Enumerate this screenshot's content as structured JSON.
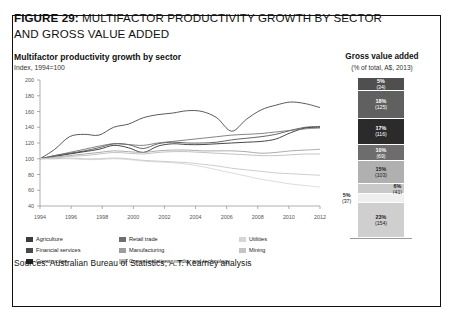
{
  "figure": {
    "number_label": "FIGURE 29:",
    "title_line1": "MULTIFACTOR PRODUCTIVITY GROWTH BY SECTOR",
    "title_line2": "AND GROSS VALUE ADDED",
    "sources": "Sources: Australian Bureau of Statistics; A.T. Kearney analysis"
  },
  "left_panel": {
    "heading": "Multifactor productivity growth by sector",
    "subheading": "Index, 1994=100"
  },
  "right_panel": {
    "heading": "Gross value added",
    "subheading": "(% of total, A$, 2013)"
  },
  "legend": {
    "columns": [
      [
        {
          "label": "Agriculture",
          "color": "#3c3c3c"
        },
        {
          "label": "Financial services",
          "color": "#4a4a4a"
        },
        {
          "label": "Construction",
          "color": "#262626"
        }
      ],
      [
        {
          "label": "Retail trade",
          "color": "#6e6e6e"
        },
        {
          "label": "Manufacturing",
          "color": "#9d9d9d"
        },
        {
          "label": "Communications, media, and technology",
          "color": "#b8b8b8"
        }
      ],
      [
        {
          "label": "Utilities",
          "color": "#d6d6d6"
        },
        {
          "label": "Mining",
          "color": "#c4c4c4"
        }
      ]
    ]
  },
  "chart_data": [
    {
      "type": "line",
      "title": "Multifactor productivity growth by sector",
      "subtitle": "Index, 1994=100",
      "xlabel": "",
      "ylabel": "Index, 1994=100",
      "xlim": [
        1994,
        2012
      ],
      "ylim": [
        40,
        200
      ],
      "yticks": [
        40,
        60,
        80,
        100,
        120,
        140,
        160,
        180,
        200
      ],
      "xticks": [
        1994,
        1996,
        1998,
        2000,
        2002,
        2004,
        2006,
        2008,
        2010,
        2012
      ],
      "grid": false,
      "legend_position": "bottom",
      "x": [
        1994,
        1995,
        1996,
        1997,
        1998,
        1999,
        2000,
        2001,
        2002,
        2003,
        2004,
        2005,
        2006,
        2007,
        2008,
        2009,
        2010,
        2011,
        2012
      ],
      "series": [
        {
          "name": "Agriculture",
          "color": "#3c3c3c",
          "values": [
            100,
            112,
            128,
            131,
            130,
            140,
            144,
            152,
            156,
            158,
            161,
            160,
            152,
            135,
            150,
            162,
            168,
            172,
            170,
            165
          ]
        },
        {
          "name": "Financial services",
          "color": "#4a4a4a",
          "values": [
            100,
            104,
            107,
            110,
            114,
            119,
            118,
            113,
            119,
            121,
            120,
            120,
            121,
            124,
            126,
            128,
            131,
            136,
            140,
            141
          ]
        },
        {
          "name": "Construction",
          "color": "#262626",
          "values": [
            100,
            103,
            106,
            109,
            112,
            117,
            114,
            108,
            116,
            119,
            118,
            118,
            119,
            120,
            121,
            122,
            125,
            133,
            139,
            140
          ]
        },
        {
          "name": "Retail trade",
          "color": "#6e6e6e",
          "values": [
            100,
            104,
            108,
            112,
            116,
            119,
            118,
            117,
            120,
            122,
            124,
            126,
            128,
            130,
            131,
            132,
            134,
            136,
            138,
            139
          ]
        },
        {
          "name": "Manufacturing",
          "color": "#9d9d9d",
          "values": [
            100,
            102,
            104,
            106,
            108,
            110,
            109,
            108,
            110,
            111,
            111,
            110,
            110,
            110,
            109,
            107,
            108,
            110,
            111,
            112
          ]
        },
        {
          "name": "Communications, media, and technology",
          "color": "#b8b8b8",
          "values": [
            100,
            101,
            103,
            104,
            106,
            108,
            107,
            106,
            108,
            109,
            109,
            108,
            107,
            106,
            105,
            104,
            104,
            105,
            106,
            106
          ]
        },
        {
          "name": "Utilities",
          "color": "#d6d6d6",
          "values": [
            100,
            100,
            100,
            99,
            99,
            100,
            99,
            97,
            96,
            95,
            93,
            90,
            86,
            82,
            78,
            74,
            71,
            68,
            66,
            64
          ]
        },
        {
          "name": "Mining",
          "color": "#c4c4c4",
          "values": [
            100,
            100,
            101,
            100,
            100,
            101,
            100,
            98,
            97,
            96,
            95,
            93,
            91,
            88,
            86,
            84,
            82,
            81,
            80,
            79
          ]
        }
      ]
    },
    {
      "type": "bar",
      "subtype": "stacked-single-column",
      "title": "Gross value added",
      "subtitle": "(% of total, A$, 2013)",
      "unit": "% of total, A$ billions, 2013",
      "segments": [
        {
          "pct_label": "5%",
          "value_label": "(34)",
          "pct": 5,
          "value": 34,
          "color": "#4f4f4f",
          "label_pos": "inside"
        },
        {
          "pct_label": "18%",
          "value_label": "(125)",
          "pct": 18,
          "value": 125,
          "color": "#606060",
          "label_pos": "inside"
        },
        {
          "pct_label": "17%",
          "value_label": "(116)",
          "pct": 17,
          "value": 116,
          "color": "#2b2b2b",
          "label_pos": "inside"
        },
        {
          "pct_label": "10%",
          "value_label": "(69)",
          "pct": 10,
          "value": 69,
          "color": "#6d6d6d",
          "label_pos": "inside"
        },
        {
          "pct_label": "15%",
          "value_label": "(103)",
          "pct": 15,
          "value": 103,
          "color": "#b0b0b0",
          "label_pos": "inside"
        },
        {
          "pct_label": "6%",
          "value_label": "(41)",
          "pct": 6,
          "value": 41,
          "color": "#c9c9c9",
          "label_pos": "right"
        },
        {
          "pct_label": "5%",
          "value_label": "(37)",
          "pct": 5,
          "value": 37,
          "color": "#efefef",
          "label_pos": "left"
        },
        {
          "pct_label": "23%",
          "value_label": "(154)",
          "pct": 23,
          "value": 154,
          "color": "#cfcfcf",
          "label_pos": "inside"
        }
      ]
    }
  ]
}
